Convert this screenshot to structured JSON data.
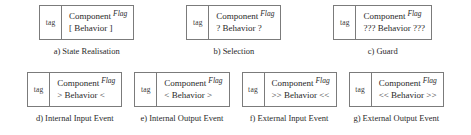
{
  "figure": {
    "tag_label": "tag",
    "component_label": "Component",
    "flag_label": "Flag",
    "border_color": "#7b7b7b",
    "text_color": "#2a2a2a",
    "background_color": "#ffffff"
  },
  "rows": [
    {
      "items": [
        {
          "tag": "tag",
          "component": "Component",
          "flag": "Flag",
          "behavior": "[ Behavior ]",
          "caption": "a) State Realisation"
        },
        {
          "tag": "tag",
          "component": "Component",
          "flag": "Flag",
          "behavior": "? Behavior ?",
          "caption": "b) Selection"
        },
        {
          "tag": "tag",
          "component": "Component",
          "flag": "Flag",
          "behavior": "??? Behavior ???",
          "caption": "c) Guard"
        }
      ]
    },
    {
      "items": [
        {
          "tag": "tag",
          "component": "Component",
          "flag": "Flag",
          "behavior": "> Behavior <",
          "caption": "d) Internal Input Event"
        },
        {
          "tag": "tag",
          "component": "Component",
          "flag": "Flag",
          "behavior": "< Behavior >",
          "caption": "e) Internal Output Event"
        },
        {
          "tag": "tag",
          "component": "Component",
          "flag": "Flag",
          "behavior": ">> Behavior <<",
          "caption": "f) External Input Event"
        },
        {
          "tag": "tag",
          "component": "Component",
          "flag": "Flag",
          "behavior": "<< Behavior >>",
          "caption": "g) External Output Event"
        }
      ]
    }
  ]
}
